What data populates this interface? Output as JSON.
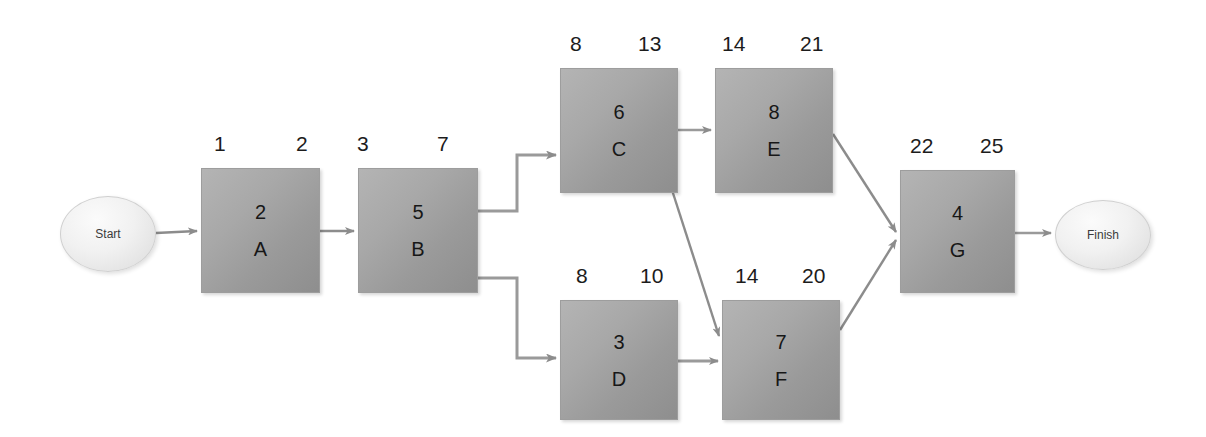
{
  "diagram": {
    "type": "pert-cpm-network-diagram",
    "title": "",
    "terminals": [
      {
        "id": "start",
        "label": "Start",
        "x": 60,
        "y": 196,
        "w": 96,
        "h": 76
      },
      {
        "id": "finish",
        "label": "Finish",
        "x": 1055,
        "y": 200,
        "w": 96,
        "h": 70
      }
    ],
    "nodes": [
      {
        "id": "A",
        "label": "A",
        "duration": "2",
        "early_start": "1",
        "early_finish": "2",
        "x": 201,
        "y": 168,
        "w": 119,
        "h": 125
      },
      {
        "id": "B",
        "label": "B",
        "duration": "5",
        "early_start": "3",
        "early_finish": "7",
        "x": 358,
        "y": 168,
        "w": 120,
        "h": 125
      },
      {
        "id": "C",
        "label": "C",
        "duration": "6",
        "early_start": "8",
        "early_finish": "13",
        "x": 560,
        "y": 68,
        "w": 118,
        "h": 125
      },
      {
        "id": "E",
        "label": "E",
        "duration": "8",
        "early_start": "14",
        "early_finish": "21",
        "x": 715,
        "y": 68,
        "w": 118,
        "h": 125
      },
      {
        "id": "D",
        "label": "D",
        "duration": "3",
        "early_start": "8",
        "early_finish": "10",
        "x": 560,
        "y": 300,
        "w": 118,
        "h": 120
      },
      {
        "id": "F",
        "label": "F",
        "duration": "7",
        "early_start": "14",
        "early_finish": "20",
        "x": 722,
        "y": 300,
        "w": 118,
        "h": 120
      },
      {
        "id": "G",
        "label": "G",
        "duration": "4",
        "early_start": "22",
        "early_finish": "25",
        "x": 900,
        "y": 170,
        "w": 115,
        "h": 123
      }
    ],
    "edges": [
      {
        "from": "start",
        "to": "A",
        "style": "straight"
      },
      {
        "from": "A",
        "to": "B",
        "style": "straight"
      },
      {
        "from": "B",
        "to": "C",
        "style": "elbow"
      },
      {
        "from": "B",
        "to": "D",
        "style": "elbow"
      },
      {
        "from": "C",
        "to": "E",
        "style": "straight"
      },
      {
        "from": "C",
        "to": "F",
        "style": "diagonal"
      },
      {
        "from": "D",
        "to": "F",
        "style": "straight"
      },
      {
        "from": "E",
        "to": "G",
        "style": "diagonal"
      },
      {
        "from": "F",
        "to": "G",
        "style": "diagonal"
      },
      {
        "from": "G",
        "to": "finish",
        "style": "straight"
      }
    ],
    "colors": {
      "node_fill_light": "#b4b4b4",
      "node_fill_dark": "#8e8e8e",
      "terminal_fill": "#f1f1f1",
      "edge_stroke": "#8c8c8c",
      "text": "#1a1a1a",
      "background": "#ffffff"
    }
  }
}
